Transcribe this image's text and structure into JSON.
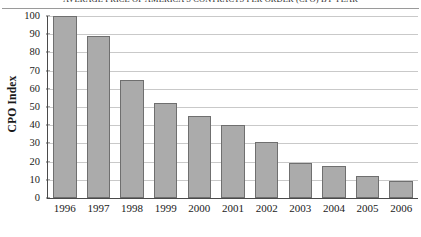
{
  "chart_data": {
    "type": "bar",
    "title": "AVERAGE PRICE OF AMERICA'S CONTRACTS PER ORDER (CPO) BY YEAR",
    "xlabel": "",
    "ylabel": "CPO Index",
    "categories": [
      "1996",
      "1997",
      "1998",
      "1999",
      "2000",
      "2001",
      "2002",
      "2003",
      "2004",
      "2005",
      "2006"
    ],
    "values": [
      100,
      89,
      65,
      52,
      45,
      40,
      31,
      19,
      17.5,
      12,
      9.5
    ],
    "ylim": [
      0,
      100
    ],
    "ytick_labels": [
      "0",
      "10",
      "20",
      "30",
      "40",
      "50",
      "60",
      "70",
      "80",
      "90",
      "100"
    ],
    "ytick_values": [
      0,
      10,
      20,
      30,
      40,
      50,
      60,
      70,
      80,
      90,
      100
    ],
    "grid": "horizontal",
    "legend": "none",
    "bar_color": "#ababab",
    "bar_border_color": "#6f6f6f",
    "gridline_color": "#c9c9c9",
    "axis_color": "#4a4a4a"
  }
}
